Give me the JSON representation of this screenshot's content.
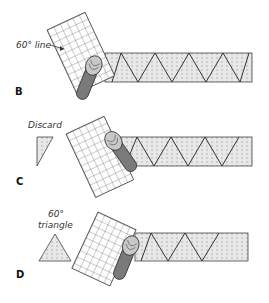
{
  "figure": {
    "panels": [
      {
        "step": "B",
        "annotation": "60° line"
      },
      {
        "step": "C",
        "annotation": "Discard"
      },
      {
        "step": "D",
        "annotation_line1": "60°",
        "annotation_line2": "triangle"
      }
    ]
  },
  "colors": {
    "strip_fill": "#e6e6e6",
    "strip_dots": "#9a9a9a",
    "line": "#333333",
    "ruler_grid": "#555555",
    "cutter_body": "#7a7a7a",
    "cutter_highlight": "#c8c8c8"
  }
}
